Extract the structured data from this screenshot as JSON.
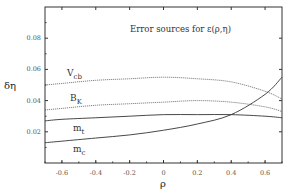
{
  "chart_data": {
    "type": "line",
    "title": "Error sources for ε(ρ,η)",
    "xlabel": "ρ",
    "ylabel": "δη",
    "xlim": [
      -0.7,
      0.7
    ],
    "ylim": [
      0.0,
      0.1
    ],
    "xticks": [
      -0.6,
      -0.4,
      -0.2,
      0,
      0.2,
      0.4,
      0.6
    ],
    "xtick_labels": [
      "-0.6",
      "-0.4",
      "-0.2",
      "0",
      "0.2",
      "0.4",
      "0.6"
    ],
    "yticks": [
      0.02,
      0.04,
      0.06,
      0.08
    ],
    "ytick_labels": [
      "0.02",
      "0.04",
      "0.06",
      "0.08"
    ],
    "grid": false,
    "legend": "inline labels",
    "x": [
      -0.7,
      -0.6,
      -0.4,
      -0.2,
      0.0,
      0.2,
      0.4,
      0.6,
      0.7
    ],
    "series": [
      {
        "name": "V_cb",
        "label_main": "V",
        "label_sub": "cb",
        "style": "dotted",
        "values": [
          0.05,
          0.051,
          0.053,
          0.054,
          0.055,
          0.054,
          0.052,
          0.046,
          0.041
        ]
      },
      {
        "name": "B_K",
        "label_main": "B",
        "label_sub": "K",
        "style": "dotted",
        "values": [
          0.034,
          0.035,
          0.037,
          0.038,
          0.039,
          0.04,
          0.039,
          0.036,
          0.033
        ]
      },
      {
        "name": "m_t",
        "label_main": "m",
        "label_sub": "t",
        "style": "solid",
        "values": [
          0.027,
          0.028,
          0.029,
          0.03,
          0.031,
          0.031,
          0.031,
          0.03,
          0.029
        ]
      },
      {
        "name": "m_c",
        "label_main": "m",
        "label_sub": "c",
        "style": "solid",
        "values": [
          0.013,
          0.014,
          0.016,
          0.018,
          0.021,
          0.025,
          0.031,
          0.044,
          0.055
        ]
      }
    ]
  },
  "labels": {
    "title": "Error sources for ε(ρ,η)",
    "xlabel": "ρ",
    "ylabel": "δη"
  }
}
